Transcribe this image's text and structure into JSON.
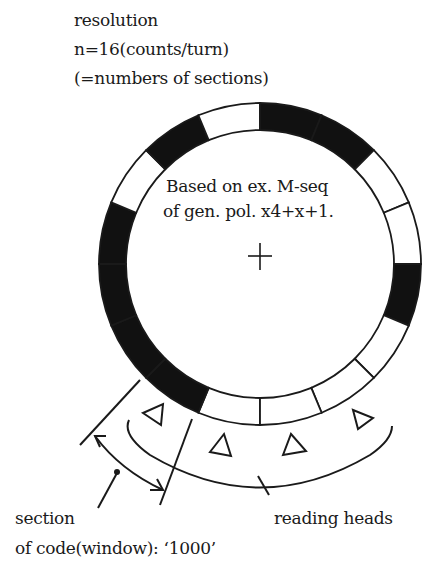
{
  "title": {
    "lines": [
      "resolution",
      "n=16(counts/turn)",
      "(=numbers of sections)"
    ]
  },
  "center_label": {
    "lines": [
      "Based on ex. M-seq",
      "of gen. pol. x4+x+1."
    ]
  },
  "labels": {
    "section_line1": "section",
    "section_line2": "of code(window): ‘1000’",
    "reading_heads": "reading heads"
  },
  "disk": {
    "sections": 16,
    "pattern_clockwise_from_bottom": [
      0,
      1,
      1,
      1,
      1,
      0,
      1,
      0,
      1,
      1,
      0,
      0,
      1,
      0,
      0,
      0
    ],
    "colors": {
      "mark": "#111111",
      "space": "#ffffff",
      "line": "#1a1a1a"
    }
  },
  "reading_heads": {
    "count": 4,
    "symbol": "triangle"
  }
}
